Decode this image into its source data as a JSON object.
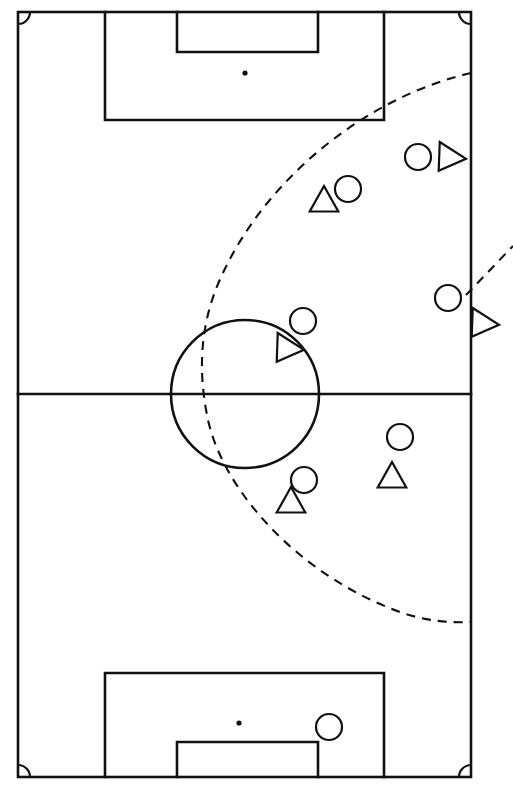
{
  "diagram": {
    "orientation": "vertical",
    "background_color": "#ffffff",
    "line_color": "#111111",
    "caption": ""
  },
  "pitch": {
    "boundary": {
      "x": 18,
      "y": 12,
      "width": 453,
      "height": 765
    },
    "halfway_line_y": 394,
    "center_circle": {
      "cx": 245,
      "cy": 394,
      "r": 74
    },
    "corner_arc_radius": 12,
    "top_penalty_area": {
      "x": 105,
      "y": 12,
      "width": 279,
      "height": 108
    },
    "top_goal_area": {
      "x": 177,
      "y": 12,
      "width": 141,
      "height": 40
    },
    "top_penalty_spot": {
      "cx": 245,
      "cy": 73,
      "r": 2.6
    },
    "bottom_penalty_area": {
      "x": 105,
      "y": 673,
      "width": 279,
      "height": 104
    },
    "bottom_goal_area": {
      "x": 177,
      "y": 742,
      "width": 141,
      "height": 35
    },
    "bottom_penalty_spot": {
      "cx": 239,
      "cy": 723,
      "r": 2.6
    }
  },
  "paths": {
    "main_run": {
      "label": "dashed-curved-run-path",
      "style": "dashed",
      "d": "M 471 73 C 370 96, 268 175, 222 275 C 196 330, 200 382, 208 420 C 224 492, 300 576, 400 612 C 425 621, 450 623, 471 622"
    },
    "secondary_run": {
      "label": "dashed-short-run-path",
      "style": "dashed",
      "d": "M 466 295 L 513 246"
    }
  },
  "markers": [
    {
      "id": "m1",
      "shape": "circle",
      "cx": 418,
      "cy": 157,
      "r": 13,
      "label": "player-circle-1"
    },
    {
      "id": "m2",
      "shape": "triangle-right",
      "cx": 451,
      "cy": 157,
      "size": 15,
      "label": "player-triangle-right-1"
    },
    {
      "id": "m3",
      "shape": "triangle-up",
      "cx": 324,
      "cy": 200,
      "size": 14,
      "label": "player-triangle-up-1"
    },
    {
      "id": "m4",
      "shape": "circle",
      "cx": 348,
      "cy": 189,
      "r": 13,
      "label": "player-circle-2"
    },
    {
      "id": "m5",
      "shape": "circle",
      "cx": 448,
      "cy": 298,
      "r": 13,
      "label": "player-circle-3"
    },
    {
      "id": "m6",
      "shape": "triangle-right",
      "cx": 484,
      "cy": 323,
      "size": 15,
      "label": "player-triangle-right-2"
    },
    {
      "id": "m7",
      "shape": "circle",
      "cx": 303,
      "cy": 321,
      "r": 13,
      "label": "player-circle-4"
    },
    {
      "id": "m8",
      "shape": "triangle-right",
      "cx": 289,
      "cy": 348,
      "size": 15,
      "label": "player-triangle-right-3"
    },
    {
      "id": "m9",
      "shape": "circle",
      "cx": 400,
      "cy": 437,
      "r": 13,
      "label": "player-circle-5"
    },
    {
      "id": "m10",
      "shape": "triangle-up",
      "cx": 392,
      "cy": 476,
      "size": 14,
      "label": "player-triangle-up-2"
    },
    {
      "id": "m11",
      "shape": "circle",
      "cx": 304,
      "cy": 480,
      "r": 13,
      "label": "player-circle-6"
    },
    {
      "id": "m12",
      "shape": "triangle-up",
      "cx": 291,
      "cy": 501,
      "size": 14,
      "label": "player-triangle-up-3"
    },
    {
      "id": "m13",
      "shape": "circle",
      "cx": 329,
      "cy": 727,
      "r": 13,
      "label": "player-circle-7"
    }
  ]
}
